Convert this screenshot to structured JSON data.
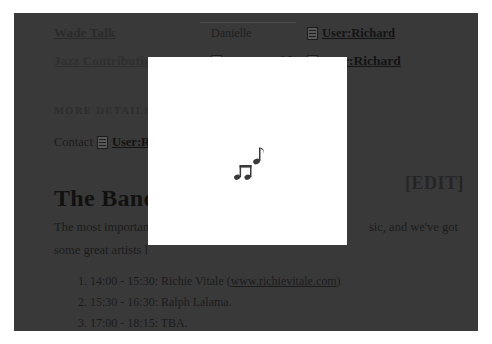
{
  "window": {
    "background_color": "#ffffff",
    "page_dim_color": "#3b3b3b"
  },
  "topnav": {
    "row1": {
      "link1": "Wade Talk",
      "name": "Danielle",
      "user_link": "User:Richard",
      "doc_icon": "document-icon"
    },
    "row2": {
      "link1": "Jazz Contributions",
      "user_link_1": "User:David",
      "user_link_2": "User:Richard",
      "doc_icon": "document-icon"
    }
  },
  "section": {
    "label": "MORE DETAILS"
  },
  "contact": {
    "label": "Contact",
    "icon": "document-icon",
    "user_link": "User:R"
  },
  "heading": {
    "title": "The Band",
    "edit_label": "[EDIT]"
  },
  "body": {
    "paragraph_left_1": "The most importan",
    "paragraph_right_1": "sic, and we've got",
    "paragraph_left_2": "some great artists l"
  },
  "setlist": {
    "items": [
      {
        "text": "14:00 - 15:30: Richie Vitale (",
        "link": "www.richievitale.com",
        "suffix": ")"
      },
      {
        "text": "15:30 - 16:30: Ralph Lalama.",
        "link": "",
        "suffix": ""
      },
      {
        "text": "17:00 - 18:15: TBA.",
        "link": "",
        "suffix": ""
      }
    ]
  },
  "modal": {
    "name": "media-loading-panel",
    "background_color": "#ffffff",
    "icon": "music-notes-icon"
  }
}
